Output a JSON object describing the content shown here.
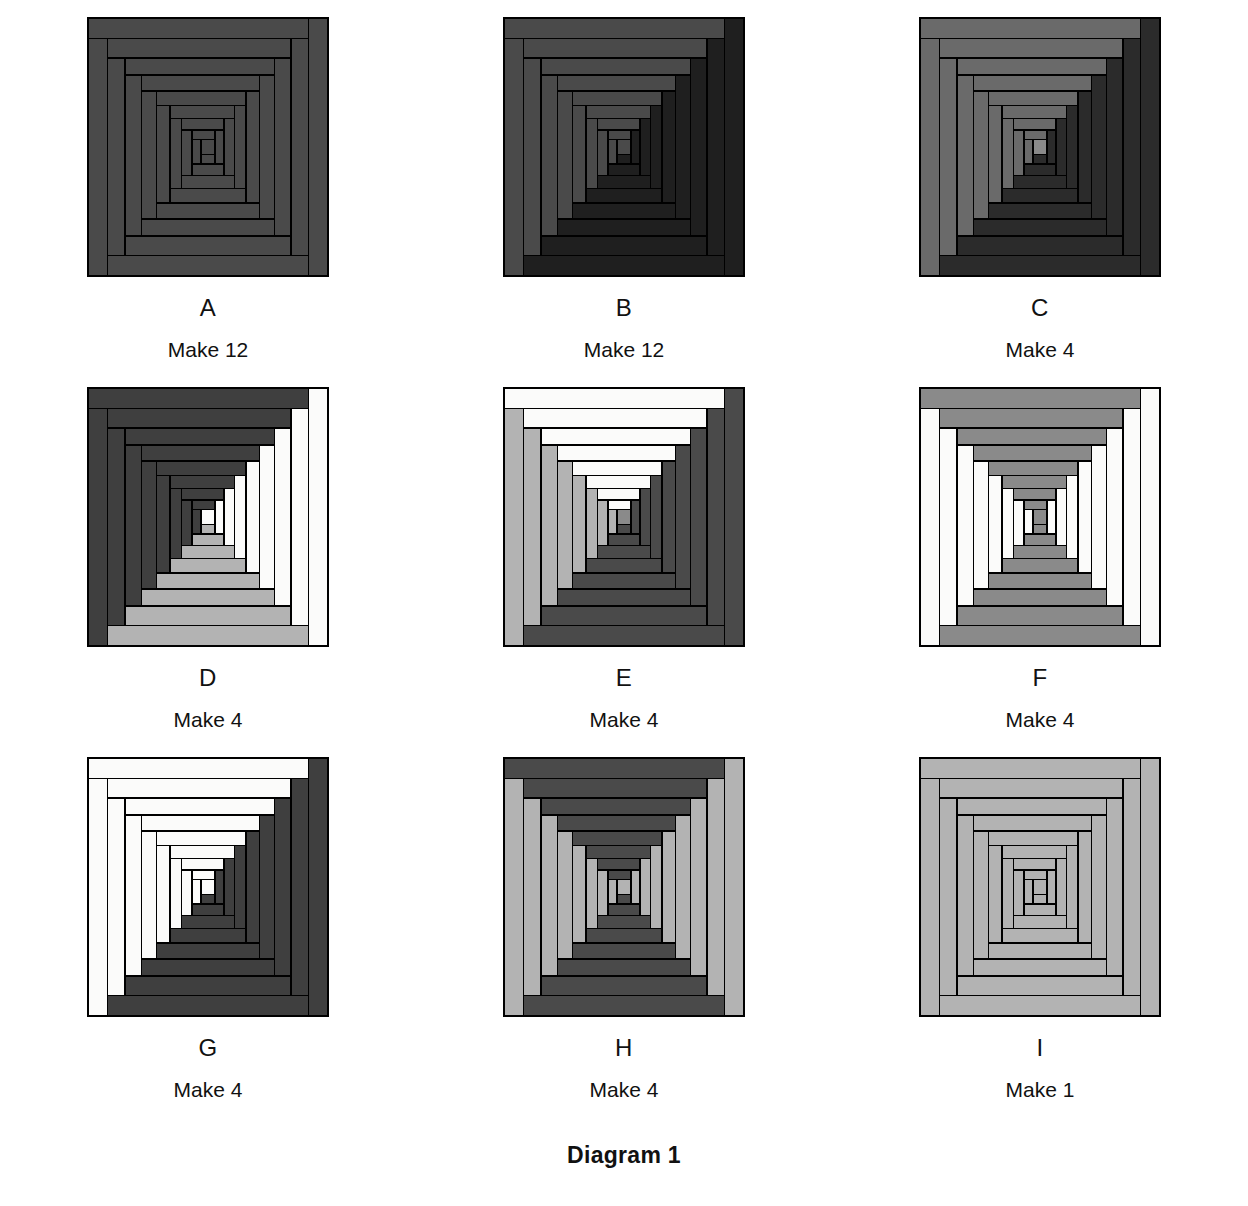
{
  "figure": {
    "caption": "Diagram 1",
    "block_pattern": "log-cabin-courthouse-steps",
    "rounds": 8,
    "center_label": "center-square"
  },
  "palette": {
    "white": "#fbfbfa",
    "light_gray": "#b3b3b3",
    "medium_gray": "#8a8a8a",
    "dark_gray": "#4a4a4a",
    "darker_gray": "#3a3a3a",
    "very_dark": "#242424",
    "near_black": "#1a1a1a",
    "outline": "#000000",
    "background": "#ffffff",
    "text": "#111111"
  },
  "blocks": [
    {
      "letter": "A",
      "make": "Make 12",
      "name": "block-a",
      "center": "#4a4a4a",
      "logs": {
        "top": "#4a4a4a",
        "left": "#4a4a4a",
        "bottom": "#4a4a4a",
        "right": "#4a4a4a"
      }
    },
    {
      "letter": "B",
      "make": "Make 12",
      "name": "block-b",
      "center": "#4a4a4a",
      "logs": {
        "top": "#4a4a4a",
        "left": "#4a4a4a",
        "bottom": "#1f1f1f",
        "right": "#1f1f1f"
      }
    },
    {
      "letter": "C",
      "make": "Make 4",
      "name": "block-c",
      "center": "#8a8a8a",
      "logs": {
        "top": "#6a6a6a",
        "left": "#6a6a6a",
        "bottom": "#2b2b2b",
        "right": "#2b2b2b"
      }
    },
    {
      "letter": "D",
      "make": "Make 4",
      "name": "block-d",
      "center": "#fbfbfa",
      "logs": {
        "top": "#3f3f3f",
        "left": "#3f3f3f",
        "bottom": "#b3b3b3",
        "right": "#fbfbfa"
      }
    },
    {
      "letter": "E",
      "make": "Make 4",
      "name": "block-e",
      "center": "#8a8a8a",
      "logs": {
        "top": "#fbfbfa",
        "left": "#b3b3b3",
        "bottom": "#4a4a4a",
        "right": "#4a4a4a"
      }
    },
    {
      "letter": "F",
      "make": "Make 4",
      "name": "block-f",
      "center": "#8a8a8a",
      "logs": {
        "top": "#8a8a8a",
        "left": "#fbfbfa",
        "bottom": "#8a8a8a",
        "right": "#fbfbfa"
      }
    },
    {
      "letter": "G",
      "make": "Make 4",
      "name": "block-g",
      "center": "#fbfbfa",
      "logs": {
        "top": "#fbfbfa",
        "left": "#fbfbfa",
        "bottom": "#3f3f3f",
        "right": "#3f3f3f"
      }
    },
    {
      "letter": "H",
      "make": "Make 4",
      "name": "block-h",
      "center": "#b3b3b3",
      "logs": {
        "top": "#4a4a4a",
        "left": "#b3b3b3",
        "bottom": "#4a4a4a",
        "right": "#b3b3b3"
      }
    },
    {
      "letter": "I",
      "make": "Make 1",
      "name": "block-i",
      "center": "#b3b3b3",
      "logs": {
        "top": "#b3b3b3",
        "left": "#b3b3b3",
        "bottom": "#b3b3b3",
        "right": "#b3b3b3"
      }
    }
  ]
}
